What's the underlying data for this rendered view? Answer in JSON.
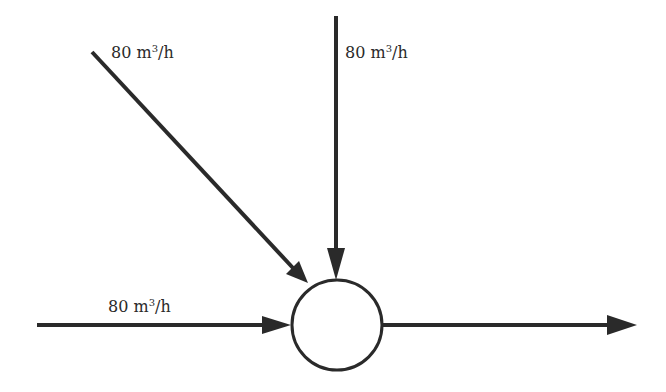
{
  "diagram": {
    "type": "flow-junction",
    "node": {
      "shape": "circle",
      "label": ""
    },
    "inflows": [
      {
        "id": "diagonal",
        "value": "80",
        "unit_base": "m",
        "unit_exp": "3",
        "unit_tail": "/h"
      },
      {
        "id": "vertical",
        "value": "80",
        "unit_base": "m",
        "unit_exp": "3",
        "unit_tail": "/h"
      },
      {
        "id": "horizontal",
        "value": "80",
        "unit_base": "m",
        "unit_exp": "3",
        "unit_tail": "/h"
      }
    ],
    "outflow": {
      "id": "output",
      "label": ""
    },
    "colors": {
      "stroke": "#2a2a2a",
      "fill": "#ffffff"
    }
  }
}
